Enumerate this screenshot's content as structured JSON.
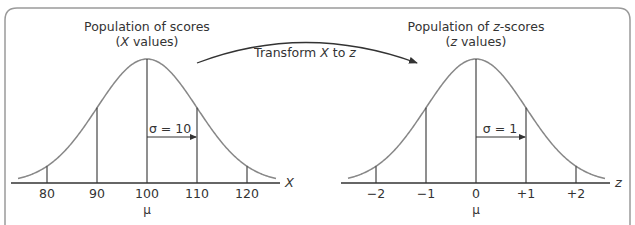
{
  "figure": {
    "frame_color": "#9a9a9a",
    "line_color": "#333333",
    "curve_color": "#888888",
    "left_panel": {
      "title_line1": "Population of scores",
      "title_line2_open": "(",
      "title_line2_var": "X",
      "title_line2_rest": " values)",
      "axis_variable": "X",
      "ticks": [
        "80",
        "90",
        "100",
        "110",
        "120"
      ],
      "mean_symbol": "μ",
      "sigma_label": "σ = 10"
    },
    "right_panel": {
      "title_line1_pre": "Population of ",
      "title_line1_var": "z",
      "title_line1_post": "-scores",
      "title_line2_open": "(",
      "title_line2_var": "z",
      "title_line2_rest": " values)",
      "axis_variable": "z",
      "ticks": [
        "−2",
        "−1",
        "0",
        "+1",
        "+2"
      ],
      "mean_symbol": "μ",
      "sigma_label": "σ = 1"
    },
    "transform_arrow": {
      "label_pre": "Transform ",
      "label_var1": "X",
      "label_mid": " to ",
      "label_var2": "z"
    }
  },
  "chart_data": [
    {
      "type": "line",
      "title": "Population of scores (X values)",
      "xlabel": "X",
      "distribution": "normal",
      "mean": 100,
      "sd": 10,
      "x_ticks": [
        80,
        90,
        100,
        110,
        120
      ],
      "marked_lines": [
        80,
        90,
        100,
        110,
        120
      ],
      "annotations": [
        "μ at 100",
        "σ = 10 arrow from 100 to 110"
      ]
    },
    {
      "type": "line",
      "title": "Population of z-scores (z values)",
      "xlabel": "z",
      "distribution": "normal",
      "mean": 0,
      "sd": 1,
      "x_ticks": [
        -2,
        -1,
        0,
        1,
        2
      ],
      "marked_lines": [
        -2,
        -1,
        0,
        1,
        2
      ],
      "annotations": [
        "μ at 0",
        "σ = 1 arrow from 0 to +1"
      ]
    }
  ]
}
